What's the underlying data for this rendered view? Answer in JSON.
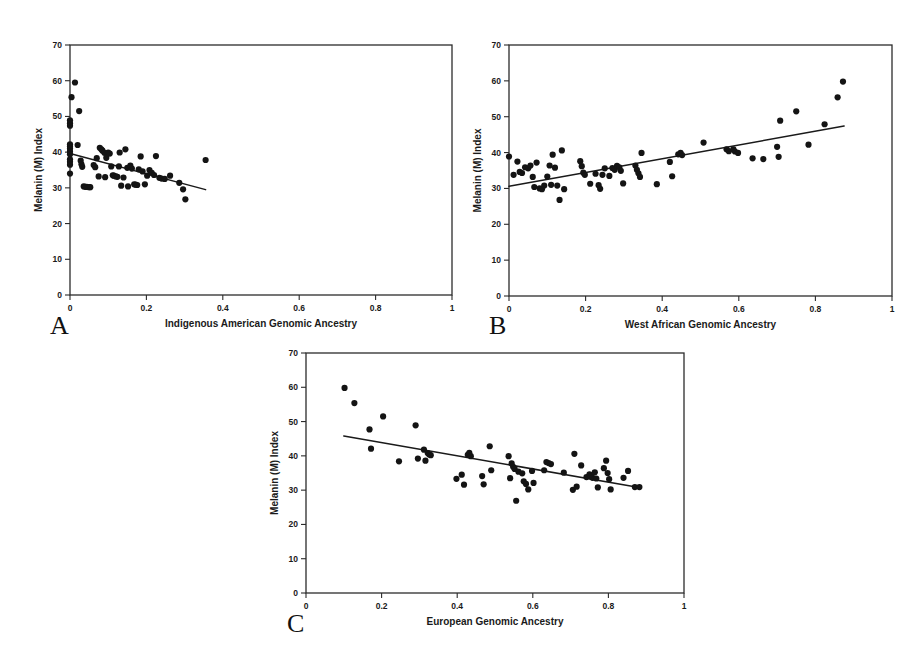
{
  "figure": {
    "background": "#ffffff",
    "marker_color": "#141414",
    "line_color": "#1a1a1a",
    "axis_color": "#2b2b2b"
  },
  "panels": [
    {
      "letter": "A",
      "name": "panel-a-indigenous-american",
      "xlabel": "Indigenous American Genomic Ancestry",
      "ylabel": "Melanin (M) Index",
      "xticks": [
        "0",
        "0.2",
        "0.4",
        "0.6",
        "0.8",
        "1"
      ],
      "xtick_values": [
        0,
        0.2,
        0.4,
        0.6,
        0.8,
        1
      ],
      "yticks": [
        "0",
        "10",
        "20",
        "30",
        "40",
        "50",
        "60",
        "70"
      ],
      "ytick_values": [
        0,
        10,
        20,
        30,
        40,
        50,
        60,
        70
      ]
    },
    {
      "letter": "B",
      "name": "panel-b-west-african",
      "xlabel": "West African Genomic Ancestry",
      "ylabel": "Melanin (M) Index",
      "xticks": [
        "0",
        "0.2",
        "0.4",
        "0.6",
        "0.8",
        "1"
      ],
      "xtick_values": [
        0,
        0.2,
        0.4,
        0.6,
        0.8,
        1
      ],
      "yticks": [
        "0",
        "10",
        "20",
        "30",
        "40",
        "50",
        "60",
        "70"
      ],
      "ytick_values": [
        0,
        10,
        20,
        30,
        40,
        50,
        60,
        70
      ]
    },
    {
      "letter": "C",
      "name": "panel-c-european",
      "xlabel": "European Genomic Ancestry",
      "ylabel": "Melanin (M) Index",
      "xticks": [
        "0",
        "0.2",
        "0.4",
        "0.6",
        "0.8",
        "1"
      ],
      "xtick_values": [
        0,
        0.2,
        0.4,
        0.6,
        0.8,
        1
      ],
      "yticks": [
        "0",
        "10",
        "20",
        "30",
        "40",
        "50",
        "60",
        "70"
      ],
      "ytick_values": [
        0,
        10,
        20,
        30,
        40,
        50,
        60,
        70
      ]
    }
  ],
  "chart_data": [
    {
      "type": "scatter",
      "panel": "A",
      "title": "",
      "xlabel": "Indigenous American Genomic Ancestry",
      "ylabel": "Melanin (M) Index",
      "xlim": [
        0,
        1
      ],
      "ylim": [
        0,
        70
      ],
      "xticks": [
        0,
        0.2,
        0.4,
        0.6,
        0.8,
        1
      ],
      "yticks": [
        0,
        10,
        20,
        30,
        40,
        50,
        60,
        70
      ],
      "grid": false,
      "legend": "none",
      "trendline": {
        "x": [
          0.0,
          0.355
        ],
        "y": [
          39.6,
          29.5
        ],
        "style": "solid"
      },
      "points": [
        [
          0.0,
          48.9
        ],
        [
          0.0,
          48.1
        ],
        [
          0.0,
          47.4
        ],
        [
          0.0,
          42.2
        ],
        [
          0.0,
          41.6
        ],
        [
          0.0,
          41.0
        ],
        [
          0.0,
          40.2
        ],
        [
          0.0,
          39.4
        ],
        [
          0.0,
          38.0
        ],
        [
          0.0,
          37.3
        ],
        [
          0.0,
          36.5
        ],
        [
          0.0,
          34.0
        ],
        [
          0.004,
          55.4
        ],
        [
          0.013,
          59.5
        ],
        [
          0.02,
          42.0
        ],
        [
          0.024,
          51.5
        ],
        [
          0.028,
          37.6
        ],
        [
          0.03,
          36.6
        ],
        [
          0.032,
          35.9
        ],
        [
          0.036,
          30.4
        ],
        [
          0.04,
          30.3
        ],
        [
          0.044,
          30.3
        ],
        [
          0.05,
          30.2
        ],
        [
          0.053,
          30.2
        ],
        [
          0.062,
          36.4
        ],
        [
          0.066,
          35.8
        ],
        [
          0.07,
          38.3
        ],
        [
          0.075,
          33.2
        ],
        [
          0.078,
          41.2
        ],
        [
          0.082,
          40.8
        ],
        [
          0.085,
          40.4
        ],
        [
          0.09,
          39.8
        ],
        [
          0.092,
          33.0
        ],
        [
          0.095,
          38.4
        ],
        [
          0.1,
          39.9
        ],
        [
          0.104,
          39.6
        ],
        [
          0.108,
          36.0
        ],
        [
          0.112,
          33.5
        ],
        [
          0.115,
          33.4
        ],
        [
          0.12,
          33.2
        ],
        [
          0.124,
          33.1
        ],
        [
          0.128,
          36.0
        ],
        [
          0.13,
          39.9
        ],
        [
          0.134,
          30.6
        ],
        [
          0.14,
          32.9
        ],
        [
          0.145,
          40.8
        ],
        [
          0.15,
          35.6
        ],
        [
          0.152,
          30.4
        ],
        [
          0.158,
          36.2
        ],
        [
          0.162,
          35.4
        ],
        [
          0.168,
          31.0
        ],
        [
          0.172,
          30.9
        ],
        [
          0.176,
          30.8
        ],
        [
          0.18,
          35.2
        ],
        [
          0.185,
          38.8
        ],
        [
          0.19,
          34.6
        ],
        [
          0.196,
          31.0
        ],
        [
          0.202,
          33.4
        ],
        [
          0.208,
          35.0
        ],
        [
          0.214,
          34.2
        ],
        [
          0.22,
          33.6
        ],
        [
          0.225,
          38.9
        ],
        [
          0.234,
          32.8
        ],
        [
          0.24,
          32.6
        ],
        [
          0.248,
          32.5
        ],
        [
          0.262,
          33.4
        ],
        [
          0.286,
          31.4
        ],
        [
          0.296,
          29.6
        ],
        [
          0.302,
          26.8
        ],
        [
          0.355,
          37.8
        ]
      ]
    },
    {
      "type": "scatter",
      "panel": "B",
      "title": "",
      "xlabel": "West African Genomic Ancestry",
      "ylabel": "Melanin (M) Index",
      "xlim": [
        0,
        1
      ],
      "ylim": [
        0,
        70
      ],
      "xticks": [
        0,
        0.2,
        0.4,
        0.6,
        0.8,
        1
      ],
      "yticks": [
        0,
        10,
        20,
        30,
        40,
        50,
        60,
        70
      ],
      "grid": false,
      "legend": "none",
      "trendline": {
        "x": [
          0.0,
          0.875
        ],
        "y": [
          30.6,
          47.4
        ],
        "style": "solid"
      },
      "points": [
        [
          0.0,
          38.9
        ],
        [
          0.012,
          33.8
        ],
        [
          0.022,
          37.5
        ],
        [
          0.028,
          34.6
        ],
        [
          0.034,
          34.3
        ],
        [
          0.042,
          35.9
        ],
        [
          0.05,
          35.6
        ],
        [
          0.056,
          36.4
        ],
        [
          0.062,
          33.2
        ],
        [
          0.066,
          30.4
        ],
        [
          0.072,
          37.2
        ],
        [
          0.08,
          30.0
        ],
        [
          0.086,
          29.8
        ],
        [
          0.092,
          30.8
        ],
        [
          0.1,
          33.3
        ],
        [
          0.106,
          36.4
        ],
        [
          0.11,
          31.0
        ],
        [
          0.114,
          39.4
        ],
        [
          0.12,
          35.8
        ],
        [
          0.126,
          30.8
        ],
        [
          0.132,
          26.8
        ],
        [
          0.138,
          40.6
        ],
        [
          0.144,
          29.8
        ],
        [
          0.186,
          37.6
        ],
        [
          0.19,
          36.2
        ],
        [
          0.194,
          34.4
        ],
        [
          0.198,
          33.8
        ],
        [
          0.212,
          31.3
        ],
        [
          0.226,
          34.1
        ],
        [
          0.234,
          30.9
        ],
        [
          0.238,
          29.9
        ],
        [
          0.244,
          33.8
        ],
        [
          0.25,
          35.6
        ],
        [
          0.262,
          33.5
        ],
        [
          0.27,
          35.7
        ],
        [
          0.276,
          35.2
        ],
        [
          0.282,
          36.3
        ],
        [
          0.288,
          35.9
        ],
        [
          0.292,
          34.9
        ],
        [
          0.298,
          31.4
        ],
        [
          0.33,
          36.4
        ],
        [
          0.334,
          35.2
        ],
        [
          0.338,
          34.2
        ],
        [
          0.342,
          33.2
        ],
        [
          0.346,
          39.9
        ],
        [
          0.386,
          31.2
        ],
        [
          0.42,
          37.4
        ],
        [
          0.426,
          33.4
        ],
        [
          0.442,
          39.5
        ],
        [
          0.448,
          39.9
        ],
        [
          0.452,
          39.3
        ],
        [
          0.508,
          42.8
        ],
        [
          0.568,
          40.9
        ],
        [
          0.574,
          40.4
        ],
        [
          0.586,
          40.9
        ],
        [
          0.59,
          40.3
        ],
        [
          0.598,
          39.9
        ],
        [
          0.636,
          38.4
        ],
        [
          0.664,
          38.2
        ],
        [
          0.7,
          41.6
        ],
        [
          0.704,
          38.8
        ],
        [
          0.708,
          48.9
        ],
        [
          0.75,
          51.5
        ],
        [
          0.782,
          42.2
        ],
        [
          0.824,
          47.9
        ],
        [
          0.858,
          55.4
        ],
        [
          0.872,
          59.8
        ]
      ]
    },
    {
      "type": "scatter",
      "panel": "C",
      "title": "",
      "xlabel": "European Genomic Ancestry",
      "ylabel": "Melanin (M) Index",
      "xlim": [
        0,
        1
      ],
      "ylim": [
        0,
        70
      ],
      "xticks": [
        0,
        0.2,
        0.4,
        0.6,
        0.8,
        1
      ],
      "yticks": [
        0,
        10,
        20,
        30,
        40,
        50,
        60,
        70
      ],
      "grid": false,
      "legend": "none",
      "trendline": {
        "x": [
          0.1,
          0.885
        ],
        "y": [
          45.8,
          30.7
        ],
        "style": "solid"
      },
      "points": [
        [
          0.102,
          59.8
        ],
        [
          0.128,
          55.4
        ],
        [
          0.168,
          47.7
        ],
        [
          0.172,
          42.1
        ],
        [
          0.204,
          51.5
        ],
        [
          0.246,
          38.4
        ],
        [
          0.29,
          48.9
        ],
        [
          0.296,
          39.2
        ],
        [
          0.312,
          41.8
        ],
        [
          0.316,
          38.6
        ],
        [
          0.322,
          40.8
        ],
        [
          0.326,
          40.4
        ],
        [
          0.33,
          40.2
        ],
        [
          0.398,
          33.3
        ],
        [
          0.412,
          34.5
        ],
        [
          0.418,
          31.6
        ],
        [
          0.428,
          40.3
        ],
        [
          0.432,
          40.9
        ],
        [
          0.436,
          39.9
        ],
        [
          0.466,
          34.1
        ],
        [
          0.47,
          31.7
        ],
        [
          0.486,
          42.8
        ],
        [
          0.49,
          35.8
        ],
        [
          0.536,
          39.9
        ],
        [
          0.54,
          33.5
        ],
        [
          0.544,
          37.8
        ],
        [
          0.548,
          36.8
        ],
        [
          0.552,
          36.2
        ],
        [
          0.556,
          26.9
        ],
        [
          0.562,
          35.4
        ],
        [
          0.572,
          34.9
        ],
        [
          0.576,
          32.6
        ],
        [
          0.582,
          31.8
        ],
        [
          0.588,
          30.2
        ],
        [
          0.598,
          35.6
        ],
        [
          0.602,
          32.1
        ],
        [
          0.63,
          35.8
        ],
        [
          0.636,
          38.2
        ],
        [
          0.642,
          37.9
        ],
        [
          0.648,
          37.6
        ],
        [
          0.682,
          35.1
        ],
        [
          0.706,
          30.1
        ],
        [
          0.71,
          40.6
        ],
        [
          0.716,
          31.0
        ],
        [
          0.728,
          37.2
        ],
        [
          0.742,
          33.8
        ],
        [
          0.75,
          34.6
        ],
        [
          0.754,
          34.0
        ],
        [
          0.758,
          33.6
        ],
        [
          0.764,
          35.2
        ],
        [
          0.768,
          33.4
        ],
        [
          0.772,
          30.8
        ],
        [
          0.788,
          36.4
        ],
        [
          0.794,
          38.6
        ],
        [
          0.798,
          35.0
        ],
        [
          0.802,
          33.2
        ],
        [
          0.806,
          30.2
        ],
        [
          0.84,
          33.6
        ],
        [
          0.852,
          35.6
        ],
        [
          0.87,
          30.9
        ],
        [
          0.882,
          30.9
        ]
      ]
    }
  ]
}
